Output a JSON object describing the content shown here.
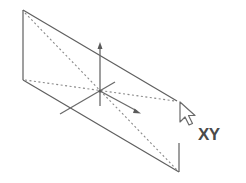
{
  "diagram": {
    "label": "XY",
    "colors": {
      "edge": "#5f5f5f",
      "diagonal": "#8a8a8a",
      "axis": "#6a6a6a",
      "label": "#4a4a4a"
    },
    "plane": {
      "corners": {
        "top_left": [
          23,
          10
        ],
        "bottom_left": [
          23,
          80
        ],
        "top_right": [
          177,
          101
        ],
        "bottom_right": [
          179,
          172
        ]
      }
    },
    "axes": {
      "origin": [
        100,
        91
      ],
      "z_axis": {
        "from": [
          100,
          106
        ],
        "to": [
          100,
          43
        ]
      },
      "x_axis": {
        "from": [
          60,
          114
        ],
        "to": [
          115,
          82
        ]
      },
      "y_axis": {
        "from": [
          100,
          91
        ],
        "to": [
          140,
          113
        ]
      }
    },
    "icons": [
      "pointer-cursor-icon"
    ]
  }
}
